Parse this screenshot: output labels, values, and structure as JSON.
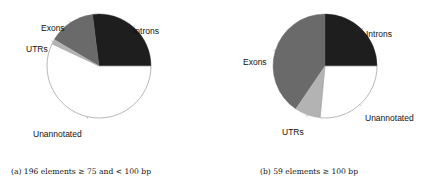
{
  "chart_data": [
    {
      "type": "pie",
      "title": "",
      "caption": "(a) 196 elements ≥ 75 and < 100 bp",
      "slices": [
        {
          "label": "Introns",
          "value": 27,
          "color": "#1e1e1e"
        },
        {
          "label": "Exons",
          "value": 14.5,
          "color": "#6a6a6a"
        },
        {
          "label": "UTRs",
          "value": 1.5,
          "color": "#b3b3b3"
        },
        {
          "label": "Unannotated",
          "value": 57,
          "color": "#ffffff"
        }
      ],
      "start_angle_deg": 0,
      "direction": "counterclockwise",
      "units": "percent"
    },
    {
      "type": "pie",
      "title": "",
      "caption": "(b) 59 elements ≥ 100 bp",
      "slices": [
        {
          "label": "Introns",
          "value": 25,
          "color": "#1e1e1e"
        },
        {
          "label": "Exons",
          "value": 40.5,
          "color": "#6a6a6a"
        },
        {
          "label": "UTRs",
          "value": 8,
          "color": "#b3b3b3"
        },
        {
          "label": "Unannotated",
          "value": 26.5,
          "color": "#ffffff"
        }
      ],
      "start_angle_deg": 0,
      "direction": "counterclockwise",
      "units": "percent"
    }
  ]
}
